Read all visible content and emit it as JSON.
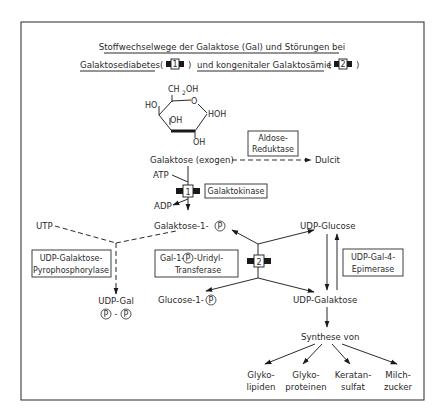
{
  "title": {
    "line1": "Stoffwechselwege der Galaktose (Gal) und Störungen bei",
    "line2_part1": "Galaktosediabetes",
    "line2_open1": "(",
    "block1_label": "1",
    "line2_close1": ")",
    "line2_part2": "und kongenitaler Galaktosämie",
    "line2_open2": "(",
    "block2_label": "2",
    "line2_close2": ")"
  },
  "structure": {
    "ch2oh": "CH",
    "ch2oh_sub": "2",
    "ch2oh_tail": "OH",
    "ring_o": "O",
    "ho_left": "HO",
    "oh_inner": "OH",
    "hoh": "HOH",
    "oh_bottom": "OH"
  },
  "nodes": {
    "galaktose_exogen": "Galaktose (exogen)",
    "dulcit": "Dulcit",
    "atp": "ATP",
    "adp": "ADP",
    "galaktose_1_p": "Galaktose-1-",
    "utp": "UTP",
    "udp_glucose": "UDP-Glucose",
    "udp_galaktose": "UDP-Galaktose",
    "glucose_1_p": "Glucose-1-",
    "udp_gal": "UDP-Gal",
    "p_dash": "-",
    "synthese_von": "Synthese von",
    "p_symbol": "P"
  },
  "enzymes": {
    "aldose_line1": "Aldose-",
    "aldose_line2": "Reduktase",
    "galaktokinase": "Galaktokinase",
    "pyro_line1": "UDP-Galaktose-",
    "pyro_line2": "Pyrophosphorylase",
    "transferase_line1a": "Gal-1-",
    "transferase_line1b": "-Uridyl-",
    "transferase_line2": "Transferase",
    "epimerase_line1": "UDP-Gal-4-",
    "epimerase_line2": "Epimerase"
  },
  "products": [
    {
      "line1": "Glyko-",
      "line2": "lipiden"
    },
    {
      "line1": "Glyko-",
      "line2": "proteinen"
    },
    {
      "line1": "Keratan-",
      "line2": "sulfat"
    },
    {
      "line1": "Milch-",
      "line2": "zucker"
    }
  ],
  "blocks": {
    "galaktokinase_block": "1",
    "transferase_block": "2"
  }
}
